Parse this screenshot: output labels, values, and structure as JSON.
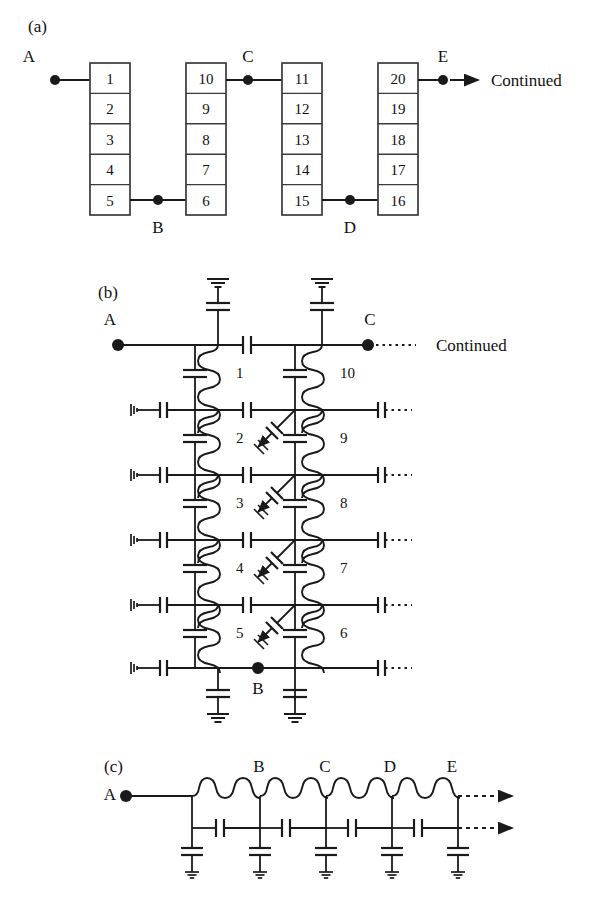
{
  "figure": {
    "background": "#ffffff",
    "stroke": "#1a1a1a",
    "panels": [
      "(a)",
      "(b)",
      "(c)"
    ]
  },
  "panel_a": {
    "label": "(a)",
    "nodes": [
      {
        "name": "A",
        "label": "A"
      },
      {
        "name": "B",
        "label": "B"
      },
      {
        "name": "C",
        "label": "C"
      },
      {
        "name": "D",
        "label": "D"
      },
      {
        "name": "E",
        "label": "E"
      }
    ],
    "continued_label": "Continued",
    "stacks": [
      {
        "name": "stack-1",
        "cells": [
          "1",
          "2",
          "3",
          "4",
          "5"
        ]
      },
      {
        "name": "stack-2",
        "cells": [
          "10",
          "9",
          "8",
          "7",
          "6"
        ]
      },
      {
        "name": "stack-3",
        "cells": [
          "11",
          "12",
          "13",
          "14",
          "15"
        ]
      },
      {
        "name": "stack-4",
        "cells": [
          "20",
          "19",
          "18",
          "17",
          "16"
        ]
      }
    ]
  },
  "panel_b": {
    "label": "(b)",
    "node_a": "A",
    "node_b": "B",
    "node_c": "C",
    "continued_label": "Continued",
    "left_coil_labels": [
      "1",
      "2",
      "3",
      "4",
      "5"
    ],
    "right_coil_labels": [
      "10",
      "9",
      "8",
      "7",
      "6"
    ],
    "row_count": 6,
    "switch_count": 4
  },
  "panel_c": {
    "label": "(c)",
    "nodes": [
      "A",
      "B",
      "C",
      "D",
      "E"
    ],
    "inductor_count": 4,
    "shunt_capacitor_count": 5,
    "series_capacitor_count": 4
  }
}
